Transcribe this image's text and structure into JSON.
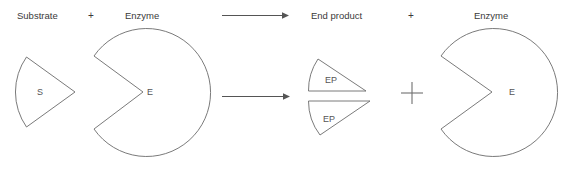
{
  "diagram": {
    "canvas": {
      "width": 569,
      "height": 170,
      "background": "#ffffff"
    },
    "colors": {
      "outline": "#6b6b6b",
      "text": "#3a3a3a",
      "shape_label": "#555555",
      "arrow": "#555555",
      "background": "#ffffff"
    },
    "headers": {
      "substrate": "Substrate",
      "plus_left": "+",
      "enzyme_left": "Enzyme",
      "end_product": "End product",
      "plus_right": "+",
      "enzyme_right": "Enzyme"
    },
    "shapes": {
      "substrate_label": "S",
      "enzyme_left_label": "E",
      "end_product_label_top": "EP",
      "end_product_label_bottom": "EP",
      "enzyme_right_label": "E"
    },
    "operators": {
      "products_plus": "+"
    },
    "arrows": [
      {
        "name": "reaction-arrow-top",
        "x1": 222,
        "y1": 15,
        "x2": 288,
        "y2": 15
      },
      {
        "name": "reaction-arrow-bottom",
        "x1": 222,
        "y1": 96,
        "x2": 289,
        "y2": 96
      }
    ]
  }
}
